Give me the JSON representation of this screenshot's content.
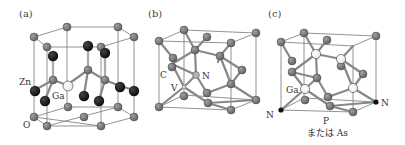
{
  "colors": {
    "background": "#ffffff",
    "cell_edge": "#777777",
    "bond": "#888888",
    "atom_gray": "#707070",
    "atom_gray_stroke": "#4a4a4a",
    "atom_black": "#111111",
    "atom_white": "#ffffff",
    "atom_white_stroke": "#555555",
    "label_text": "#333333"
  },
  "panels": [
    {
      "id": "a",
      "label": "(a)",
      "structure": "wurtzite ZnO with Ga substitution",
      "atom_labels": {
        "zn": "Zn",
        "ga": "Ga",
        "o": "O"
      }
    },
    {
      "id": "b",
      "label": "(b)",
      "structure": "diamond lattice with NV center",
      "atom_labels": {
        "c": "C",
        "n": "N",
        "v": "V"
      }
    },
    {
      "id": "c",
      "label": "(c)",
      "structure": "zincblende GaP / GaAs with N",
      "atom_labels": {
        "ga": "Ga",
        "n_left": "N",
        "n_right": "N",
        "p": "P",
        "or_as": "または As"
      }
    }
  ]
}
